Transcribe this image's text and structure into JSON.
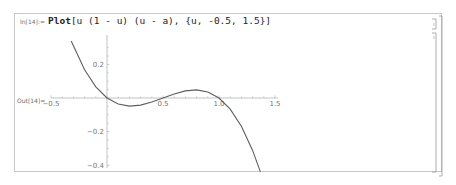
{
  "notebook": {
    "input_label": "In[14]:=",
    "input_head": "Plot",
    "input_rest": "[u (1 - u) (u - a), {u, -0.5, 1.5}]",
    "output_label": "Out[14]="
  },
  "chart_data": {
    "type": "line",
    "title": "",
    "xlabel": "",
    "ylabel": "",
    "xlim": [
      -0.5,
      1.5
    ],
    "ylim": [
      -0.4,
      0.3
    ],
    "x_ticks": [
      "-0.5",
      "0.5",
      "1.0",
      "1.5"
    ],
    "y_ticks": [
      "0.2",
      "-0.2",
      "-0.4"
    ],
    "grid": false,
    "series": [
      {
        "name": "u(1-u)(u-a), a=0.5",
        "x": [
          -0.32,
          -0.2,
          -0.1,
          0.0,
          0.1,
          0.2,
          0.3,
          0.4,
          0.5,
          0.6,
          0.7,
          0.8,
          0.9,
          1.0,
          1.1,
          1.2,
          1.3,
          1.37
        ],
        "values": [
          0.34,
          0.168,
          0.066,
          0.0,
          -0.036,
          -0.048,
          -0.042,
          -0.024,
          0.0,
          0.024,
          0.042,
          0.048,
          0.036,
          0.0,
          -0.066,
          -0.168,
          -0.312,
          -0.44
        ]
      }
    ],
    "line_color": "#5e5e5e"
  }
}
